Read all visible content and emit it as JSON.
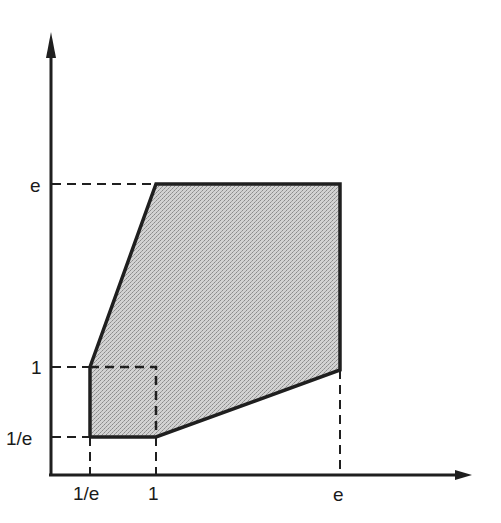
{
  "diagram": {
    "type": "region-plot",
    "axes": {
      "x_ticks": [
        {
          "label": "1/e",
          "px": 90
        },
        {
          "label": "1",
          "px": 156
        },
        {
          "label": "e",
          "px": 340
        }
      ],
      "y_ticks": [
        {
          "label": "e",
          "py": 184
        },
        {
          "label": "1",
          "py": 367
        },
        {
          "label": "1/e",
          "py": 437
        }
      ]
    },
    "region": {
      "description": "Shaded hexagonal region",
      "vertices": [
        [
          90,
          437
        ],
        [
          156,
          437
        ],
        [
          340,
          370
        ],
        [
          340,
          184
        ],
        [
          156,
          184
        ],
        [
          90,
          367
        ]
      ],
      "fill": "#c4c4c4",
      "stroke": "#1f1f1f"
    },
    "inner_square": {
      "description": "Dashed square from (1/e,1/e) to (1,1)",
      "corners": [
        [
          90,
          367
        ],
        [
          156,
          437
        ]
      ]
    },
    "labels": {
      "x_1e": "1/e",
      "x_1": "1",
      "x_e": "e",
      "y_e": "e",
      "y_1": "1",
      "y_1e": "1/e"
    }
  }
}
